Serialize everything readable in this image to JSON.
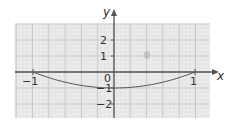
{
  "chart_data": {
    "type": "line",
    "title": "",
    "xlabel": "x",
    "ylabel": "y",
    "xlim": [
      -1.2,
      1.2
    ],
    "ylim": [
      -2.5,
      3
    ],
    "grid": true,
    "legend": null,
    "x_ticks": [
      {
        "value": -1,
        "label": "−1"
      },
      {
        "value": 1,
        "label": "1"
      }
    ],
    "y_ticks": [
      {
        "value": 2,
        "label": "2"
      },
      {
        "value": 1,
        "label": "1"
      },
      {
        "value": -1,
        "label": "−1"
      },
      {
        "value": -2,
        "label": "−2"
      }
    ],
    "origin_label": "0",
    "series": [
      {
        "name": "curve",
        "description": "parabola-like curve from (-1,0) down to (0,-1) and back up to (1,0)",
        "x": [
          -1,
          -0.75,
          -0.5,
          -0.25,
          0,
          0.25,
          0.5,
          0.75,
          1
        ],
        "y": [
          0,
          -0.44,
          -0.75,
          -0.94,
          -1,
          -0.94,
          -0.75,
          -0.44,
          0
        ],
        "color": "#555555"
      }
    ]
  },
  "colors": {
    "grid_fill": "#ececec",
    "grid_major": "#c8c8c8",
    "grid_minor": "#dedede",
    "axis": "#555555",
    "text": "#333333"
  }
}
